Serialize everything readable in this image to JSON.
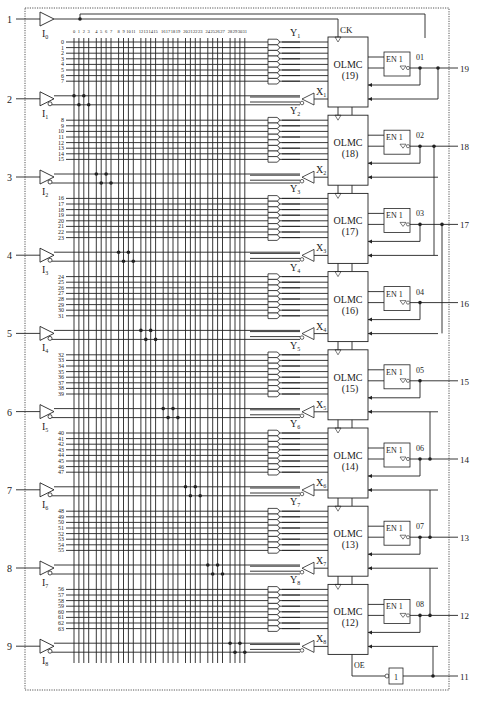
{
  "colors": {
    "line": "#222222",
    "background": "#ffffff",
    "border": "#555555"
  },
  "column_labels": [
    "0",
    "1",
    "2",
    "3",
    "4",
    "5",
    "6",
    "7",
    "8",
    "9",
    "10",
    "11",
    "12",
    "13",
    "14",
    "15",
    "16",
    "17",
    "18",
    "19",
    "20",
    "21",
    "22",
    "23",
    "24",
    "25",
    "26",
    "27",
    "28",
    "29",
    "30",
    "31"
  ],
  "inputs": [
    {
      "pin": "1",
      "label": "I",
      "sub": "0",
      "type": "clock"
    },
    {
      "pin": "2",
      "label": "I",
      "sub": "1"
    },
    {
      "pin": "3",
      "label": "I",
      "sub": "2"
    },
    {
      "pin": "4",
      "label": "I",
      "sub": "3"
    },
    {
      "pin": "5",
      "label": "I",
      "sub": "4"
    },
    {
      "pin": "6",
      "label": "I",
      "sub": "5"
    },
    {
      "pin": "7",
      "label": "I",
      "sub": "6"
    },
    {
      "pin": "8",
      "label": "I",
      "sub": "7"
    },
    {
      "pin": "9",
      "label": "I",
      "sub": "8"
    }
  ],
  "olmcs": [
    {
      "name": "OLMC",
      "num": "(19)",
      "y_label": "Y",
      "y_sub": "1",
      "x_label": "X",
      "x_sub": "1",
      "out_label": "01",
      "pin": "19",
      "terms": [
        "0",
        "1",
        "2",
        "3",
        "4",
        "5",
        "6",
        "7"
      ]
    },
    {
      "name": "OLMC",
      "num": "(18)",
      "y_label": "Y",
      "y_sub": "2",
      "x_label": "X",
      "x_sub": "2",
      "out_label": "02",
      "pin": "18",
      "terms": [
        "8",
        "9",
        "10",
        "11",
        "12",
        "13",
        "14",
        "15"
      ]
    },
    {
      "name": "OLMC",
      "num": "(17)",
      "y_label": "Y",
      "y_sub": "3",
      "x_label": "X",
      "x_sub": "3",
      "out_label": "03",
      "pin": "17",
      "terms": [
        "16",
        "17",
        "18",
        "19",
        "20",
        "21",
        "22",
        "23"
      ]
    },
    {
      "name": "OLMC",
      "num": "(16)",
      "y_label": "Y",
      "y_sub": "4",
      "x_label": "X",
      "x_sub": "4",
      "out_label": "04",
      "pin": "16",
      "terms": [
        "24",
        "25",
        "26",
        "27",
        "28",
        "29",
        "30",
        "31"
      ]
    },
    {
      "name": "OLMC",
      "num": "(15)",
      "y_label": "Y",
      "y_sub": "5",
      "x_label": "X",
      "x_sub": "5",
      "out_label": "05",
      "pin": "15",
      "terms": [
        "32",
        "33",
        "34",
        "35",
        "36",
        "37",
        "38",
        "39"
      ]
    },
    {
      "name": "OLMC",
      "num": "(14)",
      "y_label": "Y",
      "y_sub": "6",
      "x_label": "X",
      "x_sub": "6",
      "out_label": "06",
      "pin": "14",
      "terms": [
        "40",
        "41",
        "42",
        "43",
        "44",
        "45",
        "46",
        "47"
      ]
    },
    {
      "name": "OLMC",
      "num": "(13)",
      "y_label": "Y",
      "y_sub": "7",
      "x_label": "X",
      "x_sub": "7",
      "out_label": "07",
      "pin": "13",
      "terms": [
        "48",
        "49",
        "50",
        "51",
        "52",
        "53",
        "54",
        "55"
      ]
    },
    {
      "name": "OLMC",
      "num": "(12)",
      "y_label": "Y",
      "y_sub": "8",
      "x_label": "X",
      "x_sub": "8",
      "out_label": "08",
      "pin": "12",
      "terms": [
        "56",
        "57",
        "58",
        "59",
        "60",
        "61",
        "62",
        "63"
      ]
    }
  ],
  "buffer_label": "EN 1",
  "ck_label": "CK",
  "oe_label": "OE",
  "oe_pin": "11",
  "oe_gate_label": "1",
  "extra_label_x2": "X2"
}
